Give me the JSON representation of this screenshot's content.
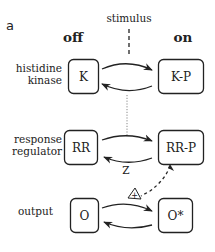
{
  "panel_label": "a",
  "stimulus_label": "stimulus",
  "column_headers": {
    "off": "off",
    "on": "on"
  },
  "rows": [
    {
      "label_lines": [
        "histidine",
        "kinase"
      ],
      "off_node": "K",
      "on_node": "K-P"
    },
    {
      "label_lines": [
        "response",
        "regulator"
      ],
      "off_node": "RR",
      "on_node": "RR-P"
    },
    {
      "label_lines": [
        "output"
      ],
      "off_node": "O",
      "on_node": "O*"
    }
  ],
  "phosphatase_label": "Z",
  "activation_symbol": "+",
  "colors": {
    "ink": "#222222",
    "background": "#ffffff",
    "dotted": "#888888"
  }
}
